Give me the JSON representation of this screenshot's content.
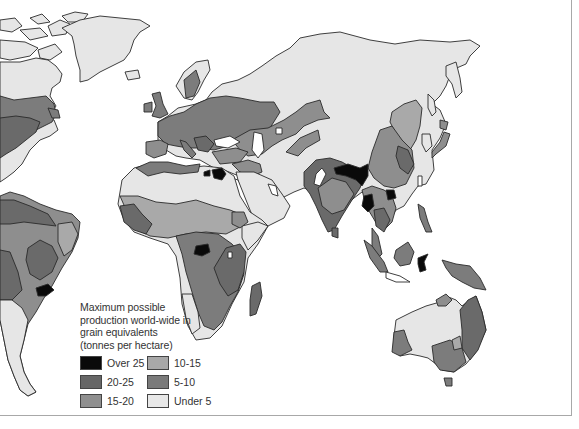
{
  "map": {
    "subject": "Maximum possible production world-wide in grain equivalents",
    "colors": {
      "ocean": "#ffffff",
      "outline": "#2a2a2a",
      "over_25": "#0a0a0a",
      "20_25": "#6a6a6a",
      "15_20": "#8e8e8e",
      "10_15": "#a9a9a9",
      "5_10": "#7c7c7c",
      "under_5": "#e6e6e6"
    }
  },
  "legend": {
    "title_lines": [
      "Maximum possible",
      "production world-wide in",
      "grain equivalents",
      "(tonnes per hectare)"
    ],
    "items": [
      {
        "label": "Over 25",
        "color": "#0a0a0a"
      },
      {
        "label": "20-25",
        "color": "#666666"
      },
      {
        "label": "15-20",
        "color": "#8f8f8f"
      },
      {
        "label": "10-15",
        "color": "#a8a8a8"
      },
      {
        "label": "5-10",
        "color": "#7a7a7a"
      },
      {
        "label": "Under 5",
        "color": "#e8e8e8"
      }
    ]
  }
}
